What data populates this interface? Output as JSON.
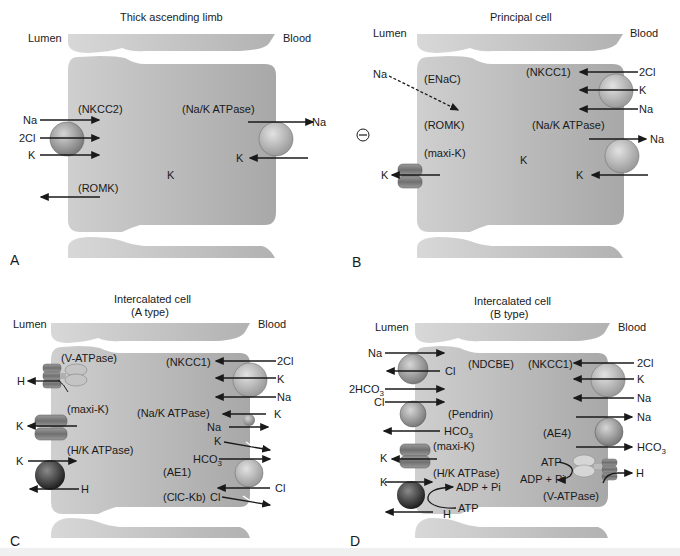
{
  "colors": {
    "cell_fill": "#b9b9b9",
    "cell_fill_light": "#d0d0d0",
    "adjacent_cell_fill": "#c8c8c8",
    "transporter_dark": "#3c3c3c",
    "transporter_mid": "#8f8f8f",
    "transporter_light": "#c2c2c2",
    "arrow": "#1a1a1a",
    "background": "#ffffff"
  },
  "panels": [
    {
      "letter": "A",
      "title": "Thick ascending limb",
      "lumen_label": "Lumen",
      "blood_label": "Blood",
      "transporters": [
        {
          "name": "(NKCC2)",
          "side": "lumen",
          "ions": [
            "Na",
            "2Cl",
            "K"
          ],
          "direction": "into cell"
        },
        {
          "name": "(ROMK)",
          "side": "lumen",
          "ions": [
            "K"
          ],
          "direction": "out to lumen"
        },
        {
          "name": "(Na/K ATPase)",
          "side": "blood",
          "ions": [
            "Na out",
            "K in"
          ]
        }
      ],
      "intracellular": "K"
    },
    {
      "letter": "B",
      "title": "Principal cell",
      "lumen_label": "Lumen",
      "blood_label": "Blood",
      "lumen_charge": "⊖",
      "transporters": [
        {
          "name": "(ENaC)",
          "side": "lumen",
          "ions": [
            "Na"
          ],
          "direction": "into cell (dashed)"
        },
        {
          "name": "(ROMK)",
          "side": "lumen"
        },
        {
          "name": "(maxi-K)",
          "side": "lumen",
          "ions": [
            "K"
          ],
          "direction": "out to lumen"
        },
        {
          "name": "(NKCC1)",
          "side": "blood",
          "ions": [
            "2Cl",
            "K",
            "Na"
          ],
          "direction": "into cell"
        },
        {
          "name": "(Na/K ATPase)",
          "side": "blood",
          "ions": [
            "Na out",
            "K in"
          ]
        }
      ],
      "intracellular": "K"
    },
    {
      "letter": "C",
      "title_line1": "Intercalated cell",
      "title_line2": "(A type)",
      "lumen_label": "Lumen",
      "blood_label": "Blood",
      "transporters": [
        {
          "name": "(V-ATPase)",
          "side": "lumen",
          "ions": [
            "H"
          ]
        },
        {
          "name": "(maxi-K)",
          "side": "lumen",
          "ions": [
            "K"
          ]
        },
        {
          "name": "(H/K ATPase)",
          "side": "lumen",
          "ions": [
            "K in",
            "H out"
          ]
        },
        {
          "name": "(NKCC1)",
          "side": "blood",
          "ions": [
            "2Cl",
            "K",
            "Na"
          ]
        },
        {
          "name": "(Na/K ATPase)",
          "side": "blood",
          "ions": [
            "K in",
            "Na out"
          ]
        },
        {
          "name": "(AE1)",
          "side": "blood",
          "ions": [
            "HCO3 out",
            "Cl in"
          ]
        },
        {
          "name": "(ClC-Kb)",
          "side": "blood",
          "ions": [
            "Cl out"
          ]
        }
      ],
      "extra_ions": [
        "K"
      ]
    },
    {
      "letter": "D",
      "title_line1": "Intercalated cell",
      "title_line2": "(B type)",
      "lumen_label": "Lumen",
      "blood_label": "Blood",
      "transporters": [
        {
          "name": "(NDCBE)",
          "side": "lumen",
          "ions": [
            "Na in",
            "Cl out",
            "2HCO3 in"
          ]
        },
        {
          "name": "(Pendrin)",
          "side": "lumen",
          "ions": [
            "Cl in",
            "HCO3 out"
          ]
        },
        {
          "name": "(maxi-K)",
          "side": "lumen",
          "ions": [
            "K out"
          ]
        },
        {
          "name": "(H/K ATPase)",
          "side": "lumen",
          "ions": [
            "K in",
            "H out"
          ],
          "energy": [
            "ATP",
            "ADP + Pi"
          ]
        },
        {
          "name": "(NKCC1)",
          "side": "blood",
          "ions": [
            "2Cl",
            "K",
            "Na"
          ]
        },
        {
          "name": "(AE4)",
          "side": "blood",
          "ions": [
            "Na out",
            "HCO3 out"
          ]
        },
        {
          "name": "(V-ATPase)",
          "side": "blood",
          "ions": [
            "H out"
          ],
          "energy": [
            "ATP",
            "ADP + Pi"
          ]
        }
      ]
    }
  ],
  "labels": {
    "A": {
      "nkcc2": "(NKCC2)",
      "naka": "(Na/K ATPase)",
      "romk": "(ROMK)",
      "k_center": "K",
      "na_in": "Na",
      "cl_in": "2Cl",
      "k_in": "K",
      "na_out": "Na",
      "k_blood": "K"
    },
    "B": {
      "enac": "(ENaC)",
      "nkcc1": "(NKCC1)",
      "romk": "(ROMK)",
      "naka": "(Na/K ATPase)",
      "maxik": "(maxi-K)",
      "k_center": "K",
      "na_lumen": "Na",
      "cl2": "2Cl",
      "k1": "K",
      "na1": "Na",
      "na_out": "Na",
      "k_blood": "K",
      "k_lumen": "K",
      "charge": "⊖"
    },
    "C": {
      "vatp": "(V-ATPase)",
      "nkcc1": "(NKCC1)",
      "maxik": "(maxi-K)",
      "naka": "(Na/K ATPase)",
      "hk": "(H/K ATPase)",
      "ae1": "(AE1)",
      "clc": "(ClC-Kb)",
      "h1": "H",
      "k_maxi": "K",
      "k_hk": "K",
      "h_hk": "H",
      "cl2": "2Cl",
      "k_nk": "K",
      "na_nk": "Na",
      "k_naka": "K",
      "na_naka": "Na",
      "k_leak": "K",
      "hco3": "HCO",
      "cl_ae": "Cl",
      "cl_clc": "Cl"
    },
    "D": {
      "ndcbe": "(NDCBE)",
      "nkcc1": "(NKCC1)",
      "pendrin": "(Pendrin)",
      "ae4": "(AE4)",
      "maxik": "(maxi-K)",
      "hk": "(H/K ATPase)",
      "vatp": "(V-ATPase)",
      "na1": "Na",
      "cl1": "Cl",
      "hco3_2": "2HCO",
      "cl2": "Cl",
      "hco3_p": "HCO",
      "k_maxi": "K",
      "k_hk": "K",
      "adp1": "ADP + Pi",
      "atp1": "ATP",
      "h_hk": "H",
      "cl_nk": "2Cl",
      "k_nk": "K",
      "na_nk": "Na",
      "na_ae": "Na",
      "hco3_ae": "HCO",
      "atp2": "ATP",
      "adp2": "ADP + Pi",
      "h_v": "H"
    },
    "sub3": "3"
  }
}
